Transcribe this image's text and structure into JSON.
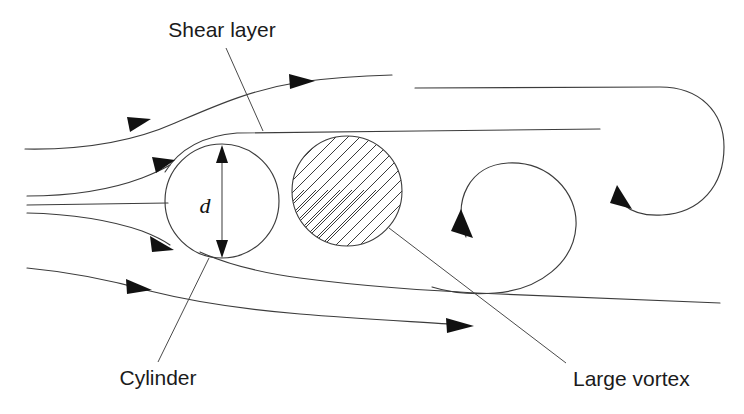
{
  "figure": {
    "background_color": "#ffffff",
    "line_color": "#3c3c3c",
    "text_color": "#1b1b1b",
    "width": 744,
    "height": 414
  },
  "labels": {
    "shear_layer": "Shear layer",
    "cylinder": "Cylinder",
    "large_vortex": "Large vortex",
    "diameter_symbol": "d"
  },
  "elements": {
    "cylinder": {
      "name": "Cylinder",
      "shape": "circle",
      "cx": 222,
      "cy": 201,
      "r": 57
    },
    "large_vortex": {
      "name": "Large vortex",
      "shape": "hatched-circle",
      "cx": 347,
      "cy": 191,
      "r": 55,
      "hatch_angle_deg": 45
    },
    "diameter_dimension": {
      "symbol": "d",
      "orientation": "vertical",
      "x": 222,
      "y_top": 146,
      "y_bottom": 257
    },
    "secondary_vortex": {
      "shape": "spiral-arc",
      "cx": 520,
      "cy": 222,
      "r": 58,
      "rotation": "clockwise"
    },
    "outer_vortex": {
      "shape": "spiral-arc",
      "rotation": "clockwise",
      "start_x": 415,
      "start_y": 88,
      "turn_x": 724
    }
  },
  "streamlines": [
    {
      "id": "upper-outer",
      "arrowheads": 2,
      "direction": "left-to-right"
    },
    {
      "id": "upper-inner",
      "arrowheads": 1,
      "direction": "left-to-right"
    },
    {
      "id": "stagnation",
      "arrowheads": 0,
      "direction": "left-to-right"
    },
    {
      "id": "lower-inner",
      "arrowheads": 1,
      "direction": "left-to-right"
    },
    {
      "id": "lower-outer",
      "arrowheads": 2,
      "direction": "left-to-right"
    }
  ]
}
